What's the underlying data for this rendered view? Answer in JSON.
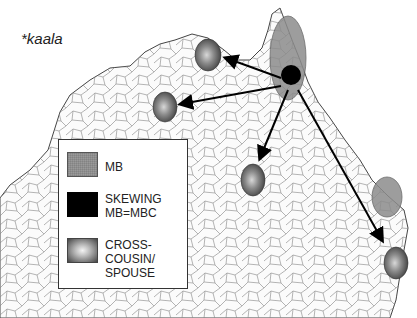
{
  "title": "*kaala",
  "legend": {
    "items": [
      {
        "key": "mb",
        "label_lines": [
          "MB"
        ],
        "swatch": "gray-stippled",
        "color": "#9a9a9a"
      },
      {
        "key": "skewing",
        "label_lines": [
          "SKEWING",
          "MB=MBC"
        ],
        "swatch": "black",
        "color": "#000000"
      },
      {
        "key": "cross-cousin",
        "label_lines": [
          "CROSS-",
          "COUSIN/",
          "SPOUSE"
        ],
        "swatch": "shaded-gradient",
        "color": "#6a6a6a"
      }
    ]
  },
  "map": {
    "region": "Northern Australia",
    "origin": {
      "type": "skewing",
      "cx": 291,
      "cy": 75,
      "r": 10
    },
    "mb_area": {
      "cx": 288,
      "cy": 58,
      "rx": 18,
      "ry": 42
    },
    "mb_area_2": {
      "cx": 387,
      "cy": 197,
      "rx": 15,
      "ry": 20
    },
    "cross_cousin_ovals": [
      {
        "cx": 208,
        "cy": 55,
        "rx": 13,
        "ry": 16
      },
      {
        "cx": 165,
        "cy": 107,
        "rx": 12,
        "ry": 15
      },
      {
        "cx": 253,
        "cy": 180,
        "rx": 12,
        "ry": 16
      },
      {
        "cx": 396,
        "cy": 263,
        "rx": 12,
        "ry": 16
      }
    ],
    "arrows": [
      {
        "from": [
          281,
          78
        ],
        "to": [
          226,
          58
        ]
      },
      {
        "from": [
          281,
          86
        ],
        "to": [
          181,
          104
        ]
      },
      {
        "from": [
          288,
          90
        ],
        "to": [
          260,
          158
        ]
      },
      {
        "from": [
          298,
          90
        ],
        "to": [
          382,
          240
        ]
      }
    ]
  }
}
